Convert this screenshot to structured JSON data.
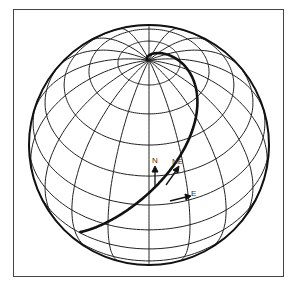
{
  "diagram": {
    "type": "globe-rhumb-line",
    "globe": {
      "cx": 149,
      "cy": 145,
      "r": 120,
      "view_lat_deg": 45,
      "lat_step_deg": 15,
      "lon_step_deg": 20
    },
    "colors": {
      "line": "#222222",
      "frame": "#444444",
      "background": "#ffffff"
    },
    "curve": {
      "name": "loxodrome",
      "heading": "NE"
    },
    "labels": {
      "north": "N",
      "northeast": "NE",
      "east": "E"
    }
  }
}
